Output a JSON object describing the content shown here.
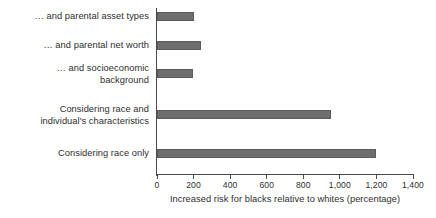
{
  "chart_data": {
    "type": "bar",
    "orientation": "horizontal",
    "title": "",
    "xlabel": "Increased risk for blacks relative to whites (percentage)",
    "ylabel": "",
    "categories": [
      "Considering race only",
      "Considering race and\nindividual's characteristics",
      "… and socioeconomic\nbackground",
      "… and parental net worth",
      "… and parental asset types"
    ],
    "values": [
      1195,
      950,
      195,
      240,
      205
    ],
    "xlim": [
      0,
      1400
    ],
    "xticks": [
      0,
      200,
      400,
      600,
      800,
      1000,
      1200,
      1400
    ],
    "xtick_labels": [
      "0",
      "200",
      "400",
      "600",
      "800",
      "1,000",
      "1,200",
      "1,400"
    ],
    "grid": false,
    "legend": null,
    "bar_color": "#6e6e6e",
    "axis_color": "#4a4a4a",
    "text_color": "#2e2e2e",
    "background": "#ffffff"
  },
  "bars": [
    {
      "label": "… and parental asset types",
      "value": 205,
      "top": 12,
      "label_top": 11
    },
    {
      "label": "… and parental net worth",
      "value": 240,
      "top": 41,
      "label_top": 40
    },
    {
      "label": "… and socioeconomic\nbackground",
      "value": 195,
      "top": 69,
      "label_top": 63
    },
    {
      "label": "Considering race and\nindividual's characteristics",
      "value": 950,
      "top": 110,
      "label_top": 104
    },
    {
      "label": "Considering race only",
      "value": 1195,
      "top": 149,
      "label_top": 148
    }
  ],
  "axis": {
    "title": "Increased risk for blacks relative to whites (percentage)",
    "ticks": [
      {
        "value": 0,
        "label": "0"
      },
      {
        "value": 200,
        "label": "200"
      },
      {
        "value": 400,
        "label": "400"
      },
      {
        "value": 600,
        "label": "600"
      },
      {
        "value": 800,
        "label": "800"
      },
      {
        "value": 1000,
        "label": "1,000"
      },
      {
        "value": 1200,
        "label": "1,200"
      },
      {
        "value": 1400,
        "label": "1,400"
      }
    ]
  }
}
